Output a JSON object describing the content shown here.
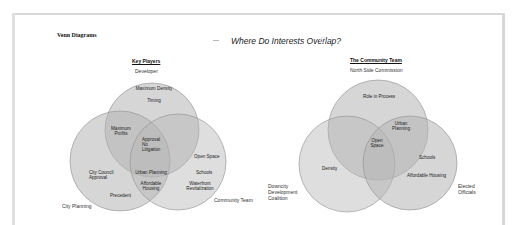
{
  "page": {
    "heading": "Venn Diagrams",
    "title": "Where Do Interests Overlap?"
  },
  "venn_left": {
    "title": "Key Players",
    "sets": [
      {
        "name": "Developer",
        "cx": 152,
        "cy": 130,
        "r": 47
      },
      {
        "name": "City Planning",
        "cx": 120,
        "cy": 161,
        "r": 50
      },
      {
        "name": "Community Team",
        "cx": 178,
        "cy": 162,
        "r": 48
      }
    ],
    "regions": {
      "developer_only": [
        "Maximum Density",
        "Timing"
      ],
      "developer_city": [
        "Maximum",
        "Profits"
      ],
      "all_three": [
        "Approval",
        "No",
        "Litigation"
      ],
      "city_only": [
        "City Council",
        "Approval",
        "Precedent"
      ],
      "city_community": [
        "Urban Planning",
        "Affordable",
        "Housing"
      ],
      "community_only": [
        "Open Space",
        "Schools",
        "Waterfront",
        "Revitalization"
      ]
    }
  },
  "venn_right": {
    "title": "The Community Team",
    "sets": [
      {
        "name": "North Side Commission",
        "cx": 378,
        "cy": 130,
        "r": 50
      },
      {
        "name": "Downcity Development Coalition",
        "lines": [
          "Downcity",
          "Development",
          "Coalition"
        ],
        "cx": 347,
        "cy": 164,
        "r": 48
      },
      {
        "name": "Elected Officials",
        "lines": [
          "Elected",
          "Officials"
        ],
        "cx": 410,
        "cy": 163,
        "r": 47
      }
    ],
    "regions": {
      "top_only": [
        "Role in Process"
      ],
      "top_right": [
        "Urban",
        "Planning"
      ],
      "all_three": [
        "Open",
        "Space"
      ],
      "left_only": [
        "Density"
      ],
      "right_only": [
        "Schools",
        "Affordable Housing"
      ]
    }
  },
  "colors": {
    "circle_fill": "#b8b8b8",
    "circle_stroke": "#8a8a8a",
    "border": "#d8d8d8"
  }
}
